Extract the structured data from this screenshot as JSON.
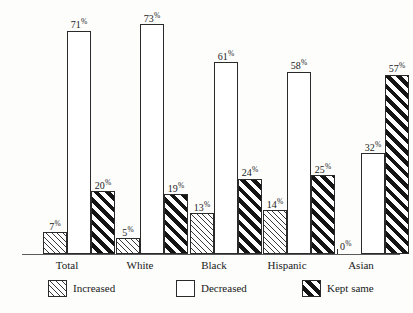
{
  "chart_data": {
    "type": "bar",
    "title": "",
    "subtitle": "",
    "xlabel": "",
    "ylabel": "",
    "ylim": [
      0,
      80
    ],
    "grid": false,
    "legend_position": "bottom",
    "value_suffix": "%",
    "categories": [
      "Total",
      "White",
      "Black",
      "Hispanic",
      "Asian"
    ],
    "series": [
      {
        "name": "Increased",
        "pattern": "thin-hatch",
        "values": [
          7,
          5,
          13,
          14,
          0
        ]
      },
      {
        "name": "Decreased",
        "pattern": "empty",
        "values": [
          71,
          73,
          61,
          58,
          32
        ]
      },
      {
        "name": "Kept same",
        "pattern": "bold-hatch",
        "values": [
          20,
          19,
          24,
          25,
          57
        ]
      }
    ],
    "data_labels": [
      [
        "7%",
        "5%",
        "13%",
        "14%",
        "0%"
      ],
      [
        "71%",
        "73%",
        "61%",
        "58%",
        "32%"
      ],
      [
        "20%",
        "19%",
        "24%",
        "25%",
        "57%"
      ]
    ]
  },
  "axis": {
    "tick_labels": [
      "Total",
      "White",
      "Black",
      "Hispanic",
      "Asian"
    ]
  },
  "legend": {
    "items": [
      {
        "label": "Increased",
        "pattern": "thin-hatch"
      },
      {
        "label": "Decreased",
        "pattern": "empty"
      },
      {
        "label": "Kept same",
        "pattern": "bold-hatch"
      }
    ]
  },
  "colors": {
    "background": "#fdfdfc",
    "bar_outline": "#2a2a2a",
    "hatch_light": "#3a3a3a",
    "hatch_bold": "#141414",
    "axis_line": "#5a5a5a",
    "text": "#1a1a1a"
  }
}
